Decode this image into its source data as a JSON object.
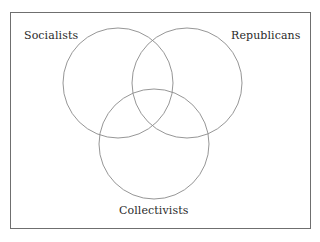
{
  "diagram": {
    "type": "venn",
    "sets": [
      {
        "id": "socialists",
        "label": "Socialists"
      },
      {
        "id": "republicans",
        "label": "Republicans"
      },
      {
        "id": "collectivists",
        "label": "Collectivists"
      }
    ],
    "colors": {
      "circle_stroke": "#8a8a8a",
      "frame_border": "#6f6f6f",
      "label_text": "#2a2a2a",
      "background": "#ffffff"
    }
  }
}
